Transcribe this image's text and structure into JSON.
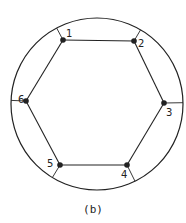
{
  "figure": {
    "caption": "(b)",
    "colors": {
      "stroke": "#222222",
      "background": "#ffffff"
    },
    "circle": {
      "cx": 97,
      "cy": 104,
      "r": 86
    },
    "vertices": [
      {
        "id": "1",
        "label": "1",
        "x": 63,
        "y": 40,
        "label_x": 66,
        "label_y": 37
      },
      {
        "id": "2",
        "label": "2",
        "x": 134,
        "y": 41,
        "label_x": 138,
        "label_y": 47
      },
      {
        "id": "3",
        "label": "3",
        "x": 164,
        "y": 103,
        "label_x": 166,
        "label_y": 116
      },
      {
        "id": "4",
        "label": "4",
        "x": 127,
        "y": 165,
        "label_x": 121,
        "label_y": 178
      },
      {
        "id": "5",
        "label": "5",
        "x": 60,
        "y": 165,
        "label_x": 47,
        "label_y": 167
      },
      {
        "id": "6",
        "label": "6",
        "x": 26,
        "y": 101,
        "label_x": 18,
        "label_y": 103
      }
    ],
    "edges": [
      [
        "1",
        "2"
      ],
      [
        "2",
        "3"
      ],
      [
        "3",
        "4"
      ],
      [
        "4",
        "5"
      ],
      [
        "5",
        "6"
      ],
      [
        "6",
        "1"
      ]
    ]
  }
}
